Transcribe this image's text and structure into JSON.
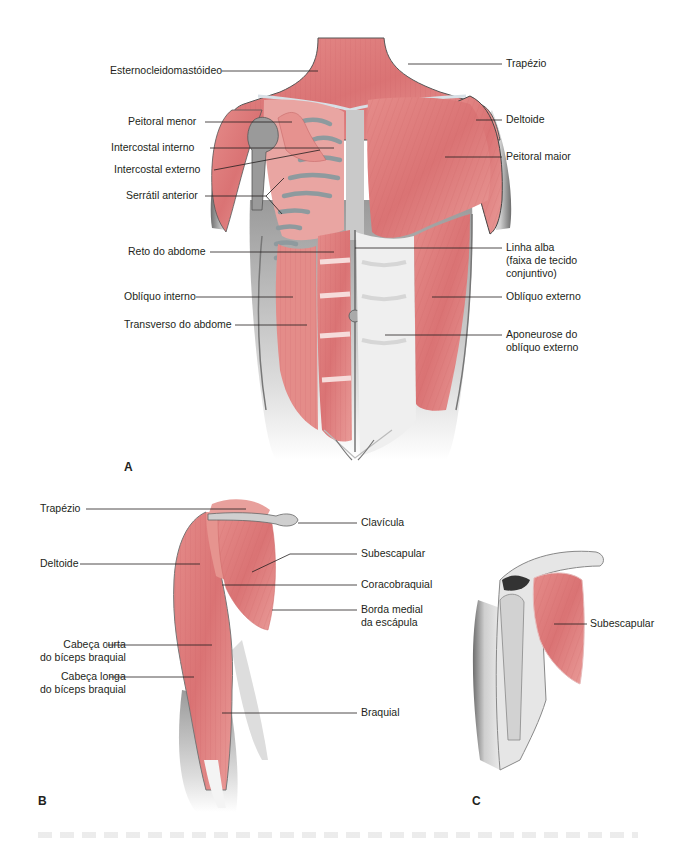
{
  "figure": {
    "colors": {
      "muscle": "#e07d7d",
      "muscle_light": "#f0b0ae",
      "muscle_dark": "#c95a5c",
      "skin": "#e8e8e8",
      "skin_shadow": "#9a9a9a",
      "bone": "#b9b9b9",
      "leader_line": "#231f20",
      "text": "#231f20"
    },
    "panels": [
      {
        "id": "A",
        "label": "A"
      },
      {
        "id": "B",
        "label": "B"
      },
      {
        "id": "C",
        "label": "C"
      }
    ],
    "panel_a": {
      "left_labels": [
        {
          "text": "Esternocleidomastóideo"
        },
        {
          "text": "Peitoral menor"
        },
        {
          "text": "Intercostal interno"
        },
        {
          "text": "Intercostal externo"
        },
        {
          "text": "Serrátil anterior"
        },
        {
          "text": "Reto do abdome"
        },
        {
          "text": "Oblíquo interno"
        },
        {
          "text": "Transverso do abdome"
        }
      ],
      "right_labels": [
        {
          "text": "Trapézio"
        },
        {
          "text": "Deltoide"
        },
        {
          "text": "Peitoral maior"
        },
        {
          "text": "Linha alba\n(faixa de tecido\nconjuntivo)",
          "lines": [
            "Linha alba",
            "(faixa de tecido",
            "conjuntivo)"
          ]
        },
        {
          "text": "Oblíquo externo"
        },
        {
          "text": "Aponeurose do\noblíquo externo",
          "lines": [
            "Aponeurose do",
            "oblíquo externo"
          ]
        }
      ]
    },
    "panel_b": {
      "left_labels": [
        {
          "text": "Trapézio"
        },
        {
          "text": "Deltoide"
        },
        {
          "text": "Cabeça curta\ndo bíceps braquial",
          "lines": [
            "Cabeça curta",
            "do bíceps braquial"
          ]
        },
        {
          "text": "Cabeça longa\ndo bíceps braquial",
          "lines": [
            "Cabeça longa",
            "do bíceps braquial"
          ]
        }
      ],
      "right_labels": [
        {
          "text": "Clavícula"
        },
        {
          "text": "Subescapular"
        },
        {
          "text": "Coracobraquial"
        },
        {
          "text": "Borda medial\nda escápula",
          "lines": [
            "Borda medial",
            "da escápula"
          ]
        },
        {
          "text": "Braquial"
        }
      ]
    },
    "panel_c": {
      "right_labels": [
        {
          "text": "Subescapular"
        }
      ]
    }
  }
}
